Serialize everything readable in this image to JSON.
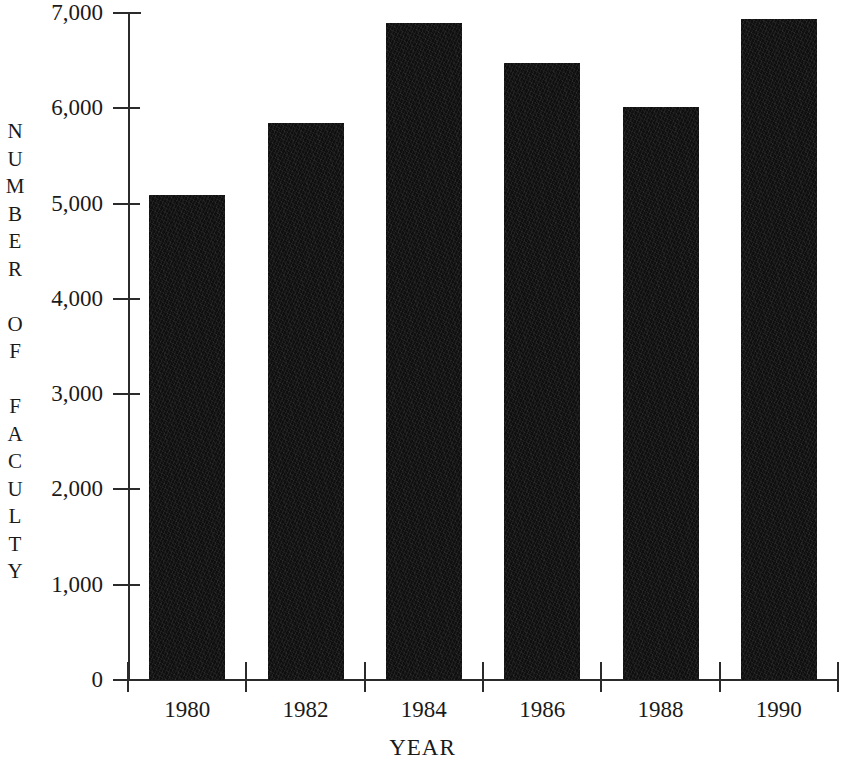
{
  "chart_data": {
    "type": "bar",
    "title": "",
    "xlabel": "YEAR",
    "ylabel": "NUMBER OF FACULTY",
    "categories": [
      "1980",
      "1982",
      "1984",
      "1986",
      "1988",
      "1990"
    ],
    "values": [
      5090,
      5850,
      6900,
      6480,
      6010,
      6940
    ],
    "series": [
      {
        "name": "Number of Faculty",
        "values": [
          5090,
          5850,
          6900,
          6480,
          6010,
          6940
        ]
      }
    ],
    "ylim": [
      0,
      7000
    ],
    "ytick_values": [
      0,
      1000,
      2000,
      3000,
      4000,
      5000,
      6000,
      7000
    ],
    "ytick_labels": [
      "0",
      "1,000",
      "2,000",
      "3,000",
      "4,000",
      "5,000",
      "6,000",
      "7,000"
    ],
    "xtick_labels": [
      "1980",
      "1982",
      "1984",
      "1986",
      "1988",
      "1990"
    ],
    "grid": false,
    "legend": false,
    "legend_position": "none",
    "bar_color": "#100f0f",
    "axis_color": "#2b2b2b",
    "background_color": "#ffffff"
  },
  "axes": {
    "y_title_letters": [
      "N",
      "U",
      "M",
      "B",
      "E",
      "R",
      "",
      "O",
      "F",
      "",
      "F",
      "A",
      "C",
      "U",
      "L",
      "T",
      "Y"
    ],
    "x_title": "YEAR"
  }
}
